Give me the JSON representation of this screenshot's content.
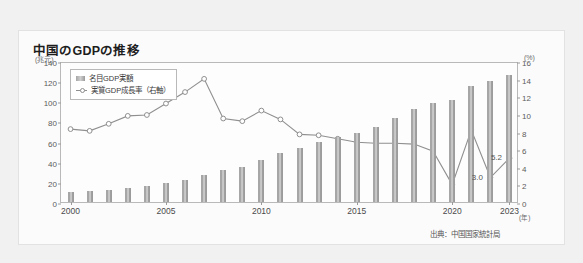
{
  "card": {
    "title": "中国のGDPの推移",
    "source": "出典：中国国家統計局"
  },
  "axes": {
    "left_unit": "(兆元)",
    "right_unit": "(%)",
    "x_unit": "(年)"
  },
  "chart_data": {
    "type": "bar",
    "title": "中国のGDPの推移",
    "xlabel": "(年)",
    "ylabel": "(兆元)",
    "y2label": "(%)",
    "ylim": [
      0,
      140
    ],
    "y2lim": [
      0,
      16
    ],
    "yticks": [
      0,
      20,
      40,
      60,
      80,
      100,
      120,
      140
    ],
    "y2ticks": [
      0,
      2,
      4,
      6,
      8,
      10,
      12,
      14,
      16
    ],
    "xticks": [
      "2000",
      "2005",
      "2010",
      "2015",
      "2020",
      "2023"
    ],
    "grid": false,
    "legend_position": "top-left",
    "categories": [
      "2000",
      "2001",
      "2002",
      "2003",
      "2004",
      "2005",
      "2006",
      "2007",
      "2010",
      "2009",
      "2010",
      "2011",
      "2012",
      "2013",
      "2014",
      "2015",
      "2016",
      "2017",
      "2018",
      "2019",
      "2020",
      "2021",
      "2022",
      "2023"
    ],
    "x": [
      2000,
      2001,
      2002,
      2003,
      2004,
      2005,
      2006,
      2007,
      2008,
      2009,
      2010,
      2011,
      2012,
      2013,
      2014,
      2015,
      2016,
      2017,
      2018,
      2019,
      2020,
      2021,
      2022,
      2023
    ],
    "series": [
      {
        "name": "名目GDP実額",
        "type": "bar",
        "axis": "left",
        "unit": "兆元",
        "values": [
          10.0,
          11.1,
          12.2,
          13.8,
          16.2,
          18.7,
          21.9,
          27.0,
          32.0,
          34.9,
          41.3,
          48.8,
          53.9,
          59.6,
          64.4,
          68.9,
          74.6,
          83.2,
          91.9,
          98.7,
          101.4,
          114.9,
          120.5,
          126.1
        ]
      },
      {
        "name": "実質GDP成長率（右軸）",
        "type": "line",
        "axis": "right",
        "unit": "%",
        "values": [
          8.5,
          8.3,
          9.1,
          10.0,
          10.1,
          11.4,
          12.7,
          14.2,
          9.7,
          9.4,
          10.6,
          9.6,
          7.9,
          7.8,
          7.4,
          7.0,
          6.9,
          6.9,
          6.8,
          6.0,
          2.2,
          8.4,
          3.0,
          5.2
        ]
      }
    ],
    "annotations": [
      {
        "label": "3.0",
        "x": 2022,
        "value": 3.0
      },
      {
        "label": "5.2",
        "x": 2023,
        "value": 5.2
      }
    ],
    "legend": [
      "名目GDP実額",
      "実質GDP成長率（右軸）"
    ],
    "colors": {
      "bar": "#a6a6a6",
      "line": "#8f8f8f",
      "marker_fill": "#ffffff",
      "frame": "#b9b9b9",
      "card_bg": "#fbfbfb",
      "page_bg": "#f1f1f1"
    }
  }
}
